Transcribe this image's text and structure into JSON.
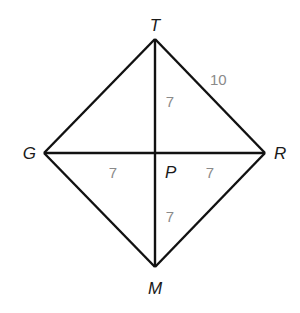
{
  "diagram": {
    "type": "rhombus-with-diagonals",
    "colors": {
      "line": "#111111",
      "vertex_label": "#1a1a1a",
      "measure_label": "#8a8a8a",
      "background": "#ffffff"
    },
    "vertices": {
      "T": {
        "label": "T",
        "x": 155,
        "y": 39
      },
      "R": {
        "label": "R",
        "x": 265,
        "y": 153
      },
      "M": {
        "label": "M",
        "x": 155,
        "y": 267
      },
      "G": {
        "label": "G",
        "x": 44,
        "y": 153
      },
      "P": {
        "label": "P",
        "x": 155,
        "y": 153
      }
    },
    "segments": [
      {
        "from": "T",
        "to": "R"
      },
      {
        "from": "R",
        "to": "M"
      },
      {
        "from": "M",
        "to": "G"
      },
      {
        "from": "G",
        "to": "T"
      },
      {
        "from": "T",
        "to": "M"
      },
      {
        "from": "G",
        "to": "R"
      }
    ],
    "measures": {
      "TR": "10",
      "TP": "7",
      "GP": "7",
      "PR": "7",
      "PM": "7"
    }
  }
}
